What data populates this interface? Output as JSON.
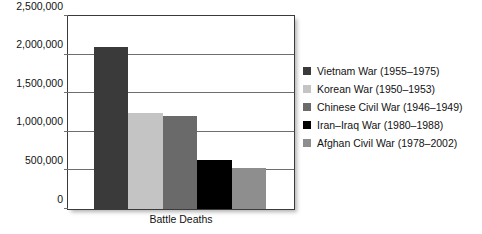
{
  "chart_data": {
    "type": "bar",
    "title": "",
    "subtitle": "",
    "xlabel": "Battle Deaths",
    "ylabel": "",
    "categories": [
      "Vietnam War (1955–1975)",
      "Korean War (1950–1953)",
      "Chinese Civil War (1946–1949)",
      "Iran–Iraq War (1980–1988)",
      "Afghan Civil War (1978–2002)"
    ],
    "values": [
      2100000,
      1250000,
      1200000,
      640000,
      530000
    ],
    "colors": [
      "#3a3a3a",
      "#c4c4c4",
      "#6a6a6a",
      "#000000",
      "#8e8e8e"
    ],
    "ylim": [
      0,
      2500000
    ],
    "ytick_values": [
      0,
      500000,
      1000000,
      1500000,
      2000000,
      2500000
    ],
    "ytick_labels": [
      "0",
      "500,000",
      "1,000,000",
      "1,500,000",
      "2,000,000",
      "2,500,000"
    ],
    "grid": true,
    "legend_position": "right",
    "legend": [
      {
        "label": "Vietnam War (1955–1975)",
        "color": "#3a3a3a"
      },
      {
        "label": "Korean War (1950–1953)",
        "color": "#c4c4c4"
      },
      {
        "label": "Chinese Civil War (1946–1949)",
        "color": "#6a6a6a"
      },
      {
        "label": "Iran–Iraq War (1980–1988)",
        "color": "#000000"
      },
      {
        "label": "Afghan Civil War (1978–2002)",
        "color": "#8e8e8e"
      }
    ]
  }
}
